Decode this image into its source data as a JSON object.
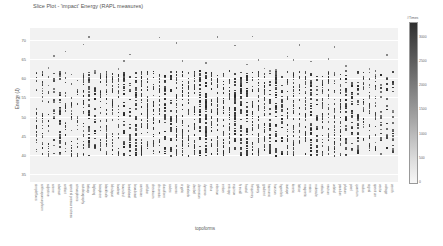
{
  "chart_data": {
    "type": "heatmap",
    "subtype": "strip / slice plot",
    "title": "Slice Plot - 'impact' Energy (RAPL measures)",
    "xlabel": "topoforms",
    "ylabel": "Energy (J)",
    "y_ticks": [
      70,
      65,
      60,
      55,
      50,
      45,
      40,
      35
    ],
    "ylim": [
      33,
      73
    ],
    "grid": true,
    "colorbar": {
      "title": "#Times",
      "ticks": [
        3000,
        2500,
        2000,
        1500,
        1000,
        500,
        0
      ],
      "range": [
        0,
        3300
      ],
      "colors": [
        "#f7f7f7",
        "#303030"
      ]
    },
    "categories": [
      "simpleflows",
      "anthropomorphism",
      "adjective",
      "anime",
      "abstract",
      "artifact",
      "spectral pressure stress",
      "atmospheric",
      "autobiography",
      "bebop",
      "bigbang",
      "biosphere",
      "blackhole",
      "blindspot",
      "boolean",
      "bounded",
      "breakbeat",
      "broadcast",
      "cartesian",
      "cellular",
      "checksum",
      "chromatic",
      "cloudform",
      "codec",
      "cosmic",
      "cryptic",
      "databank",
      "decibel",
      "dimension",
      "dynamo",
      "echo",
      "electron",
      "ember",
      "entropy",
      "equinox",
      "firewall",
      "fractal",
      "frequency",
      "galaxy",
      "gradient",
      "harmonic",
      "horizon",
      "hyperlink",
      "isotope",
      "kinetic",
      "lattice",
      "magnetic",
      "matrix",
      "molecule",
      "nebula",
      "neutron",
      "orbital",
      "paradox",
      "photon",
      "pixel",
      "quantum",
      "radius",
      "signal",
      "spectrum",
      "vector",
      "voltage",
      "zenith"
    ],
    "series_note": "Each category is a vertical strip of energy samples; denser (darker) marks where more runs share the same value. Most mass falls between ~40 and ~62 J.",
    "density_profile": {
      "center_range": [
        40,
        62
      ],
      "outlier_range": [
        35,
        72
      ],
      "peak_region_categories": [
        "cosmic",
        "cryptic",
        "databank",
        "decibel",
        "dimension",
        "dynamo"
      ]
    }
  },
  "ui": {
    "title": "Slice Plot - 'impact' Energy (RAPL measures)",
    "xlabel": "topoforms",
    "ylabel": "Energy (J)",
    "colorbar_title": "#Times"
  }
}
